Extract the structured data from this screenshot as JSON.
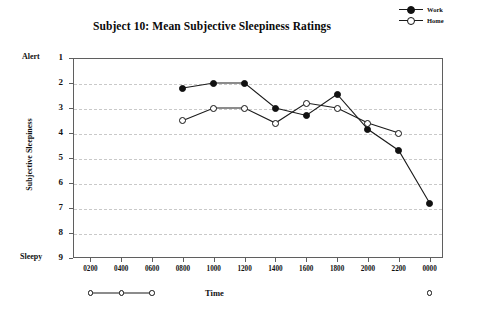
{
  "chart_data": {
    "type": "line",
    "title": "Subject 10: Mean Subjective Sleepiness Ratings",
    "xlabel": "Time",
    "ylabel": "Subjective Sleepiness",
    "y_axis_top_label": "Alert",
    "y_axis_bottom_label": "Sleepy",
    "categories": [
      "0200",
      "0400",
      "0600",
      "0800",
      "1000",
      "1200",
      "1400",
      "1600",
      "1800",
      "2000",
      "2200",
      "0000"
    ],
    "x_tick_labels": [
      "0200",
      "0400",
      "0600",
      "0800",
      "1000",
      "1200",
      "1400",
      "1600",
      "1800",
      "2000",
      "2200",
      "0000"
    ],
    "y_tick_labels": [
      "1",
      "2",
      "3",
      "4",
      "5",
      "6",
      "7",
      "8",
      "9"
    ],
    "ylim": [
      1,
      9
    ],
    "y_inverted": true,
    "grid": "horizontal-dashed",
    "legend_position": "top-right",
    "series": [
      {
        "name": "Work",
        "marker": "filled-circle",
        "color": "#111111",
        "points": [
          {
            "x": "0800",
            "y": 2.2
          },
          {
            "x": "1000",
            "y": 2.0
          },
          {
            "x": "1200",
            "y": 2.0
          },
          {
            "x": "1400",
            "y": 3.0
          },
          {
            "x": "1600",
            "y": 3.3
          },
          {
            "x": "1800",
            "y": 2.45
          },
          {
            "x": "2000",
            "y": 3.85
          },
          {
            "x": "2200",
            "y": 4.7
          },
          {
            "x": "0000",
            "y": 6.8
          }
        ]
      },
      {
        "name": "Home",
        "marker": "open-circle",
        "color": "#111111",
        "points": [
          {
            "x": "0800",
            "y": 3.5
          },
          {
            "x": "1000",
            "y": 3.0
          },
          {
            "x": "1200",
            "y": 3.0
          },
          {
            "x": "1400",
            "y": 3.6
          },
          {
            "x": "1600",
            "y": 2.8
          },
          {
            "x": "1800",
            "y": 3.0
          },
          {
            "x": "2000",
            "y": 3.6
          },
          {
            "x": "2200",
            "y": 4.0
          }
        ],
        "below_axis_points": [
          {
            "x": "0200",
            "y": "off-scale"
          },
          {
            "x": "0400",
            "y": "off-scale"
          },
          {
            "x": "0600",
            "y": "off-scale"
          },
          {
            "x": "0000",
            "y": "off-scale"
          }
        ]
      }
    ]
  },
  "legend": {
    "entries": [
      {
        "label": "Work",
        "marker": "filled-circle"
      },
      {
        "label": "Home",
        "marker": "open-circle"
      }
    ]
  }
}
